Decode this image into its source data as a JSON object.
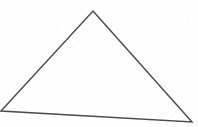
{
  "figure": {
    "medium": "scanned-line-drawing",
    "canvas": {
      "width": 198,
      "height": 127,
      "background_color": "#fefefe"
    },
    "stroke": {
      "color": "#4a4a4a",
      "width": 1.4,
      "linejoin": "miter",
      "linecap": "butt",
      "fill": "none"
    },
    "shape": {
      "name": "triangle",
      "sides": 3,
      "vertices": [
        {
          "label": "apex",
          "x": 93,
          "y": 11
        },
        {
          "label": "bottom-right",
          "x": 192,
          "y": 122
        },
        {
          "label": "bottom-left",
          "x": 1,
          "y": 111
        }
      ],
      "edges": [
        {
          "label": "left-edge",
          "from": "bottom-left",
          "to": "apex"
        },
        {
          "label": "right-edge",
          "from": "apex",
          "to": "bottom-right"
        },
        {
          "label": "base-edge",
          "from": "bottom-left",
          "to": "bottom-right"
        }
      ],
      "path": "M 93 11 L 192 122 L 1 111 Z",
      "clipped_at_left_edge": true
    },
    "noise": {
      "color": "#bdbdbd",
      "speckles": [
        {
          "x": 11,
          "y": 19,
          "r": 0.6
        },
        {
          "x": 24,
          "y": 33,
          "r": 0.5
        },
        {
          "x": 38,
          "y": 14,
          "r": 0.5
        },
        {
          "x": 57,
          "y": 26,
          "r": 0.6
        },
        {
          "x": 73,
          "y": 47,
          "r": 0.5
        },
        {
          "x": 88,
          "y": 62,
          "r": 0.5
        },
        {
          "x": 112,
          "y": 30,
          "r": 0.6
        },
        {
          "x": 131,
          "y": 18,
          "r": 0.5
        },
        {
          "x": 149,
          "y": 55,
          "r": 0.5
        },
        {
          "x": 166,
          "y": 41,
          "r": 0.6
        },
        {
          "x": 180,
          "y": 72,
          "r": 0.5
        },
        {
          "x": 19,
          "y": 86,
          "r": 0.5
        },
        {
          "x": 45,
          "y": 99,
          "r": 0.6
        },
        {
          "x": 64,
          "y": 78,
          "r": 0.5
        },
        {
          "x": 97,
          "y": 92,
          "r": 0.5
        },
        {
          "x": 122,
          "y": 104,
          "r": 0.5
        },
        {
          "x": 158,
          "y": 95,
          "r": 0.6
        },
        {
          "x": 188,
          "y": 23,
          "r": 0.5
        },
        {
          "x": 6,
          "y": 58,
          "r": 0.5
        },
        {
          "x": 142,
          "y": 8,
          "r": 0.5
        },
        {
          "x": 30,
          "y": 120,
          "r": 0.5
        },
        {
          "x": 79,
          "y": 122,
          "r": 0.5
        },
        {
          "x": 173,
          "y": 116,
          "r": 0.5
        },
        {
          "x": 104,
          "y": 6,
          "r": 0.5
        }
      ]
    }
  }
}
